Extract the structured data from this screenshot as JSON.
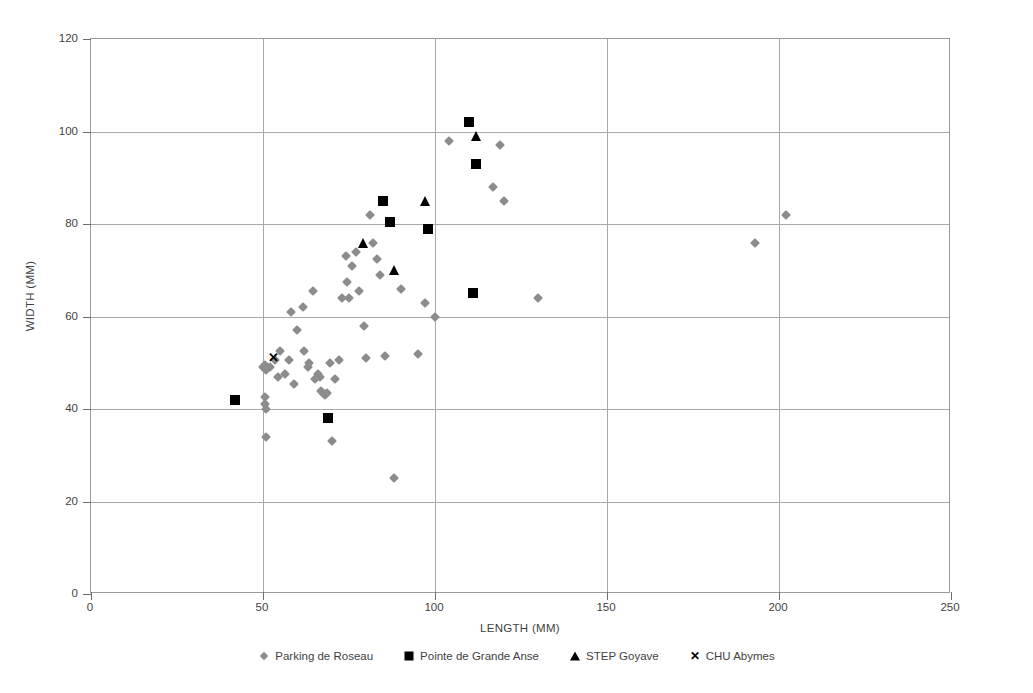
{
  "chart_data": {
    "type": "scatter",
    "title": "",
    "xlabel": "LENGTH (MM)",
    "ylabel": "WIDTH (MM)",
    "xlim": [
      0,
      250
    ],
    "ylim": [
      0,
      120
    ],
    "xticks": [
      0,
      50,
      100,
      150,
      200,
      250
    ],
    "yticks": [
      0,
      20,
      40,
      60,
      80,
      100,
      120
    ],
    "grid": true,
    "legend_position": "bottom",
    "series": [
      {
        "name": "Parking de Roseau",
        "marker": "diamond",
        "color": "#8c8c8c",
        "points": [
          [
            50,
            49
          ],
          [
            50.5,
            49.5
          ],
          [
            51,
            48.5
          ],
          [
            52,
            49
          ],
          [
            53.5,
            50.5
          ],
          [
            55,
            52.5
          ],
          [
            54.5,
            47
          ],
          [
            56.5,
            47.5
          ],
          [
            57.5,
            50.5
          ],
          [
            58,
            61
          ],
          [
            60,
            57
          ],
          [
            61.5,
            62
          ],
          [
            62,
            52.5
          ],
          [
            63,
            49
          ],
          [
            63.5,
            50
          ],
          [
            64.5,
            65.5
          ],
          [
            65,
            46.5
          ],
          [
            66,
            47.5
          ],
          [
            66.5,
            47
          ],
          [
            67,
            44
          ],
          [
            67.5,
            43.5
          ],
          [
            68,
            43
          ],
          [
            68.5,
            43.5
          ],
          [
            69.5,
            50
          ],
          [
            70,
            33
          ],
          [
            72,
            50.5
          ],
          [
            73,
            64
          ],
          [
            74,
            73
          ],
          [
            74.5,
            67.5
          ],
          [
            75,
            64
          ],
          [
            76,
            71
          ],
          [
            77,
            74
          ],
          [
            78,
            65.5
          ],
          [
            79.5,
            58
          ],
          [
            80,
            51
          ],
          [
            81,
            82
          ],
          [
            82,
            76
          ],
          [
            83,
            72.5
          ],
          [
            84,
            69
          ],
          [
            85.5,
            51.5
          ],
          [
            88,
            25
          ],
          [
            90,
            66
          ],
          [
            95,
            52
          ],
          [
            97,
            63
          ],
          [
            100,
            60
          ],
          [
            104,
            98
          ],
          [
            117,
            88
          ],
          [
            119,
            97
          ],
          [
            120,
            85
          ],
          [
            130,
            64
          ],
          [
            193,
            76
          ],
          [
            202,
            82
          ],
          [
            50.5,
            41
          ],
          [
            50.5,
            42.5
          ],
          [
            51,
            34
          ],
          [
            51,
            40
          ],
          [
            59,
            45.5
          ],
          [
            71,
            46.5
          ]
        ]
      },
      {
        "name": "Pointe de Grande Anse",
        "marker": "square",
        "color": "#000000",
        "points": [
          [
            42,
            42
          ],
          [
            69,
            38
          ],
          [
            85,
            85
          ],
          [
            87,
            80.5
          ],
          [
            98,
            79
          ],
          [
            110,
            102
          ],
          [
            112,
            93
          ],
          [
            111,
            65
          ]
        ]
      },
      {
        "name": "STEP Goyave",
        "marker": "triangle",
        "color": "#000000",
        "points": [
          [
            79,
            76
          ],
          [
            88,
            70
          ],
          [
            97,
            85
          ],
          [
            112,
            99
          ]
        ]
      },
      {
        "name": "CHU Abymes",
        "marker": "cross",
        "color": "#000000",
        "points": [
          [
            53,
            51
          ]
        ]
      }
    ]
  },
  "axes": {
    "x_title": "LENGTH (MM)",
    "y_title": "WIDTH (MM)",
    "x_tick_labels": [
      "0",
      "50",
      "100",
      "150",
      "200",
      "250"
    ],
    "y_tick_labels": [
      "0",
      "20",
      "40",
      "60",
      "80",
      "100",
      "120"
    ]
  },
  "legend": {
    "items": [
      {
        "label": "Parking de Roseau",
        "marker": "diamond-icon"
      },
      {
        "label": "Pointe de Grande Anse",
        "marker": "square-icon"
      },
      {
        "label": "STEP Goyave",
        "marker": "triangle-icon"
      },
      {
        "label": "CHU Abymes",
        "marker": "cross-icon"
      }
    ]
  },
  "colors": {
    "series_gray": "#8c8c8c",
    "series_black": "#000000",
    "gridline": "#a8a8a8",
    "frame": "#9a9a9a",
    "text": "#3f3f3f",
    "background": "#ffffff"
  }
}
